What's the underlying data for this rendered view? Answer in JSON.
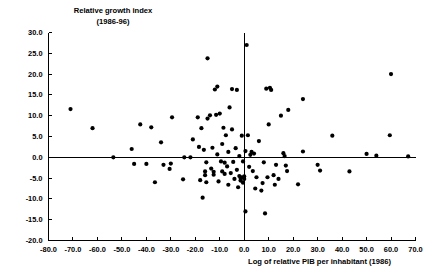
{
  "chart_data": {
    "type": "scatter",
    "title": "",
    "ylabel_line1": "Relative growth index",
    "ylabel_line2": "(1986-96)",
    "xlabel": "Log of relative PIB per inhabitant (1986)",
    "xlim": [
      -80.0,
      70.0
    ],
    "ylim": [
      -20.0,
      30.0
    ],
    "xticks": [
      "-80.0",
      "-70.0",
      "-60.0",
      "-50.0",
      "-40.0",
      "-30.0",
      "-20.0",
      "-10.0",
      "0.0",
      "10.0",
      "20.0",
      "30.0",
      "40.0",
      "50.0",
      "60.0",
      "70.0"
    ],
    "xtick_values": [
      -80.0,
      -70.0,
      -60.0,
      -50.0,
      -40.0,
      -30.0,
      -20.0,
      -10.0,
      0.0,
      10.0,
      20.0,
      30.0,
      40.0,
      50.0,
      60.0,
      70.0
    ],
    "yticks": [
      "30.0",
      "25.0",
      "20.0",
      "15.0",
      "10.0",
      "5.0",
      "0.0",
      "-5.0",
      "-10.0",
      "-15.0",
      "-20.0"
    ],
    "ytick_values": [
      30.0,
      25.0,
      20.0,
      15.0,
      10.0,
      5.0,
      0.0,
      -5.0,
      -10.0,
      -15.0,
      -20.0
    ],
    "grid": false,
    "legend": null,
    "marker_color": "#000000",
    "marker_size": 2.1,
    "axis_color": "#000000",
    "zero_lines": {
      "x": 0.0,
      "y": 0.0
    },
    "points": [
      [
        -71.0,
        11.6
      ],
      [
        -62.0,
        7.0
      ],
      [
        -53.5,
        0.0
      ],
      [
        -46.0,
        2.0
      ],
      [
        -45.0,
        -1.6
      ],
      [
        -42.5,
        7.9
      ],
      [
        -40.0,
        -1.6
      ],
      [
        -38.0,
        7.2
      ],
      [
        -36.5,
        -6.0
      ],
      [
        -34.0,
        3.6
      ],
      [
        -33.0,
        -1.8
      ],
      [
        -30.5,
        -2.8
      ],
      [
        -30.0,
        -1.5
      ],
      [
        -29.5,
        9.6
      ],
      [
        -25.0,
        -5.3
      ],
      [
        -24.5,
        0.0
      ],
      [
        -22.0,
        0.0
      ],
      [
        -21.0,
        4.3
      ],
      [
        -19.0,
        9.6
      ],
      [
        -18.5,
        2.5
      ],
      [
        -18.0,
        -5.5
      ],
      [
        -17.5,
        7.0
      ],
      [
        -17.0,
        -9.7
      ],
      [
        -16.5,
        1.8
      ],
      [
        -16.0,
        -3.4
      ],
      [
        -16.0,
        -4.3
      ],
      [
        -15.5,
        -1.2
      ],
      [
        -15.5,
        -6.0
      ],
      [
        -15.0,
        9.3
      ],
      [
        -15.0,
        23.8
      ],
      [
        -14.0,
        10.1
      ],
      [
        -13.5,
        -2.7
      ],
      [
        -13.0,
        2.3
      ],
      [
        -12.5,
        -3.5
      ],
      [
        -12.5,
        -4.2
      ],
      [
        -12.0,
        16.3
      ],
      [
        -11.5,
        10.2
      ],
      [
        -11.0,
        17.0
      ],
      [
        -11.0,
        0.7
      ],
      [
        -10.5,
        -5.8
      ],
      [
        -10.0,
        10.5
      ],
      [
        -9.5,
        -1.0
      ],
      [
        -9.0,
        3.2
      ],
      [
        -9.0,
        -3.4
      ],
      [
        -8.5,
        7.1
      ],
      [
        -8.0,
        -1.3
      ],
      [
        -8.0,
        -4.0
      ],
      [
        -7.5,
        5.3
      ],
      [
        -7.0,
        -2.2
      ],
      [
        -6.5,
        1.3
      ],
      [
        -6.5,
        -6.6
      ],
      [
        -6.0,
        12.0
      ],
      [
        -5.5,
        -3.8
      ],
      [
        -5.0,
        16.4
      ],
      [
        -5.0,
        6.7
      ],
      [
        -4.5,
        -1.1
      ],
      [
        -4.0,
        -5.2
      ],
      [
        -3.5,
        2.2
      ],
      [
        -3.0,
        16.2
      ],
      [
        -3.0,
        -3.0
      ],
      [
        -2.5,
        -7.2
      ],
      [
        -2.0,
        0.3
      ],
      [
        -2.0,
        -4.5
      ],
      [
        -1.5,
        -5.0
      ],
      [
        -1.5,
        -5.6
      ],
      [
        -1.0,
        5.2
      ],
      [
        -1.0,
        -4.8
      ],
      [
        -0.5,
        -1.0
      ],
      [
        -0.5,
        -6.1
      ],
      [
        0.0,
        -4.6
      ],
      [
        0.0,
        -5.2
      ],
      [
        0.5,
        1.5
      ],
      [
        0.5,
        -13.0
      ],
      [
        1.0,
        27.0
      ],
      [
        1.5,
        5.3
      ],
      [
        2.0,
        -2.3
      ],
      [
        2.5,
        0.6
      ],
      [
        3.0,
        1.3
      ],
      [
        3.5,
        -3.3
      ],
      [
        4.0,
        0.9
      ],
      [
        4.5,
        -7.5
      ],
      [
        5.0,
        -4.8
      ],
      [
        6.0,
        3.9
      ],
      [
        7.0,
        -8.0
      ],
      [
        7.5,
        -6.2
      ],
      [
        8.0,
        -1.2
      ],
      [
        8.5,
        -13.5
      ],
      [
        9.0,
        16.5
      ],
      [
        9.5,
        -4.8
      ],
      [
        10.0,
        7.9
      ],
      [
        10.5,
        16.7
      ],
      [
        11.0,
        16.2
      ],
      [
        12.0,
        -4.3
      ],
      [
        12.5,
        -6.6
      ],
      [
        13.0,
        -1.8
      ],
      [
        14.0,
        -5.2
      ],
      [
        15.0,
        10.0
      ],
      [
        16.0,
        1.0
      ],
      [
        16.5,
        0.3
      ],
      [
        17.0,
        -2.0
      ],
      [
        17.5,
        -3.3
      ],
      [
        18.0,
        11.4
      ],
      [
        22.0,
        -6.5
      ],
      [
        24.0,
        14.0
      ],
      [
        24.0,
        1.4
      ],
      [
        30.0,
        -1.8
      ],
      [
        31.0,
        -3.2
      ],
      [
        36.0,
        5.2
      ],
      [
        43.0,
        -3.4
      ],
      [
        50.0,
        0.8
      ],
      [
        54.0,
        0.4
      ],
      [
        59.5,
        5.3
      ],
      [
        60.0,
        20.0
      ],
      [
        67.0,
        0.2
      ]
    ]
  }
}
